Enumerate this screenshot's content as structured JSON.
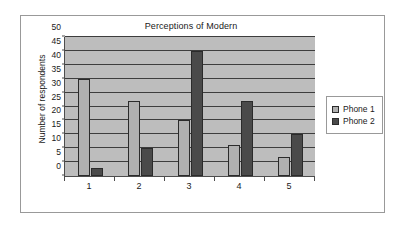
{
  "chart_data": {
    "type": "bar",
    "title": "Perceptions of Modern",
    "xlabel": "",
    "ylabel": "Number of respondents",
    "categories": [
      "1",
      "2",
      "3",
      "4",
      "5"
    ],
    "series": [
      {
        "name": "Phone 1",
        "color": "#b0b0b0",
        "values": [
          35,
          27,
          20,
          11,
          7
        ]
      },
      {
        "name": "Phone 2",
        "color": "#4a4a4a",
        "values": [
          3,
          10,
          45,
          27,
          15
        ]
      }
    ],
    "ylim": [
      0,
      50
    ],
    "ytick_step": 5,
    "yticks": [
      0,
      5,
      10,
      15,
      20,
      25,
      30,
      35,
      40,
      45,
      50
    ],
    "ytick_labels": [
      "0",
      "5",
      "10",
      "15",
      "20",
      "25",
      "30",
      "35",
      "40",
      "45",
      "50"
    ],
    "grid": true,
    "grid_axis": "y",
    "legend_position": "right",
    "plot_background": "#bdbdbd",
    "figure_background": "#ffffff",
    "axis_color": "#4d4d4d",
    "border_color": "#999999"
  }
}
